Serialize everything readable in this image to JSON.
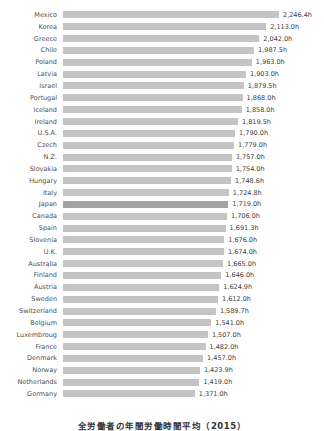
{
  "chart_data": {
    "type": "bar",
    "orientation": "horizontal",
    "title": "全労働者の年間労働時間平均（2015）",
    "xlabel": "",
    "ylabel": "",
    "xlim": [
      0,
      2350
    ],
    "grid": false,
    "legend": "none",
    "value_suffix": "h",
    "bar_color": "#c4c4c4",
    "highlight_color": "#a3a3a3",
    "highlight_category": "Japan",
    "categories": [
      "Mexico",
      "Korea",
      "Greece",
      "Chile",
      "Poland",
      "Latvia",
      "Israel",
      "Portugal",
      "Iceland",
      "Ireland",
      "U.S.A.",
      "Czech",
      "N.Z.",
      "Slovakia",
      "Hungary",
      "Italy",
      "Japan",
      "Canada",
      "Spain",
      "Slovenia",
      "U.K.",
      "Australia",
      "Finland",
      "Austria",
      "Sweden",
      "Switzerland",
      "Belgium",
      "Luxembroug",
      "France",
      "Denmark",
      "Norway",
      "Netherlands",
      "Germany"
    ],
    "values": [
      2246.4,
      2113.0,
      2042.0,
      1987.5,
      1963.0,
      1903.0,
      1879.5,
      1868.0,
      1858.0,
      1819.5,
      1790.0,
      1779.0,
      1757.0,
      1754.0,
      1748.6,
      1724.8,
      1719.0,
      1706.0,
      1691.3,
      1676.0,
      1674.0,
      1665.0,
      1646.0,
      1624.9,
      1612.0,
      1589.7,
      1541.0,
      1507.0,
      1482.0,
      1457.0,
      1423.9,
      1419.0,
      1371.0
    ],
    "value_labels": [
      "2,246.4h",
      "2,113.0h",
      "2,042.0h",
      "1,987.5h",
      "1,963.0h",
      "1,903.0h",
      "1,879.5h",
      "1,868.0h",
      "1,858.0h",
      "1,819.5h",
      "1,790.0h",
      "1,779.0h",
      "1,757.0h",
      "1,754.0h",
      "1,748.6h",
      "1,724.8h",
      "1,719.0h",
      "1,706.0h",
      "1,691.3h",
      "1,676.0h",
      "1,674.0h",
      "1,665.0h",
      "1,646.0h",
      "1,624.9h",
      "1,612.0h",
      "1,589.7h",
      "1,541.0h",
      "1,507.0h",
      "1,482.0h",
      "1,457.0h",
      "1,423.9h",
      "1,419.0h",
      "1,371.0h"
    ]
  },
  "caption": {
    "text": "全労働者の年間労働時間平均（2015）"
  }
}
